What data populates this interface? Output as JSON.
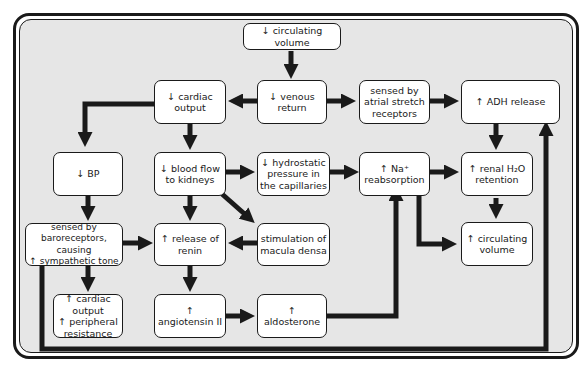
{
  "diagram": {
    "title": "",
    "nodes": [
      {
        "id": "circ_vol_down",
        "label": "↓ circulating volume"
      },
      {
        "id": "cardiac_output_down",
        "label": "↓ cardiac\noutput"
      },
      {
        "id": "venous_return_down",
        "label": "↓ venous\nreturn"
      },
      {
        "id": "atrial_stretch",
        "label": "sensed by\natrial stretch\nreceptors"
      },
      {
        "id": "adh_up",
        "label": "↑ ADH release"
      },
      {
        "id": "bp_down",
        "label": "↓ BP"
      },
      {
        "id": "blood_flow_kidneys_down",
        "label": "↓ blood flow\nto kidneys"
      },
      {
        "id": "hydrostatic_down",
        "label": "↓ hydrostatic\npressure in\nthe capillaries"
      },
      {
        "id": "na_reabs_up",
        "label": "↑ Na⁺\nreabsorption"
      },
      {
        "id": "renal_h2o_up",
        "label": "↑ renal H₂O\nretention"
      },
      {
        "id": "baroreceptors",
        "label": "sensed by baroreceptors,\ncausing\n↑ sympathetic tone"
      },
      {
        "id": "renin_up",
        "label": "↑ release of\nrenin"
      },
      {
        "id": "macula_densa",
        "label": "stimulation of\nmacula densa"
      },
      {
        "id": "circ_vol_up",
        "label": "↑ circulating\nvolume"
      },
      {
        "id": "co_pr_up",
        "label": "↑ cardiac output\n↑ peripheral\nresistance"
      },
      {
        "id": "angiotensin_up",
        "label": "↑ angiotensin II"
      },
      {
        "id": "aldosterone_up",
        "label": "↑ aldosterone"
      }
    ],
    "edges": [
      {
        "from": "circ_vol_down",
        "to": "venous_return_down"
      },
      {
        "from": "venous_return_down",
        "to": "cardiac_output_down"
      },
      {
        "from": "venous_return_down",
        "to": "atrial_stretch"
      },
      {
        "from": "atrial_stretch",
        "to": "adh_up"
      },
      {
        "from": "cardiac_output_down",
        "to": "bp_down"
      },
      {
        "from": "cardiac_output_down",
        "to": "blood_flow_kidneys_down"
      },
      {
        "from": "blood_flow_kidneys_down",
        "to": "hydrostatic_down"
      },
      {
        "from": "hydrostatic_down",
        "to": "na_reabs_up"
      },
      {
        "from": "na_reabs_up",
        "to": "renal_h2o_up"
      },
      {
        "from": "adh_up",
        "to": "renal_h2o_up"
      },
      {
        "from": "renal_h2o_up",
        "to": "circ_vol_up"
      },
      {
        "from": "na_reabs_up",
        "to": "circ_vol_up"
      },
      {
        "from": "bp_down",
        "to": "baroreceptors"
      },
      {
        "from": "blood_flow_kidneys_down",
        "to": "renin_up"
      },
      {
        "from": "blood_flow_kidneys_down",
        "to": "macula_densa"
      },
      {
        "from": "baroreceptors",
        "to": "renin_up"
      },
      {
        "from": "macula_densa",
        "to": "renin_up"
      },
      {
        "from": "baroreceptors",
        "to": "co_pr_up"
      },
      {
        "from": "renin_up",
        "to": "angiotensin_up"
      },
      {
        "from": "angiotensin_up",
        "to": "aldosterone_up"
      },
      {
        "from": "aldosterone_up",
        "to": "na_reabs_up"
      },
      {
        "from": "baroreceptors",
        "to": "adh_up"
      }
    ]
  },
  "colors": {
    "background": "#e6e6e6",
    "box": "#ffffff",
    "stroke": "#1a1a1a"
  }
}
